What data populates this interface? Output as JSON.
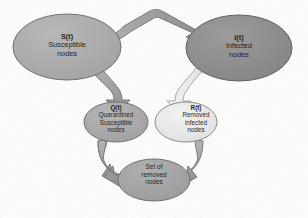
{
  "diagram": {
    "background_color": "#fdfdfc",
    "nodes": [
      {
        "id": "susceptible",
        "symbol": "S(t)",
        "line2": "Susceptible",
        "line3": "nodes",
        "fill": "#a9a9a9",
        "stroke": "#6e6e6e"
      },
      {
        "id": "infected",
        "symbol": "I(t)",
        "line2": "Infected",
        "line3": "nodes",
        "fill": "#8c8c8c",
        "stroke": "#5e5e5e"
      },
      {
        "id": "quarantined",
        "symbol": "Q(t)",
        "line2": "Quarantined",
        "line3": "Susceptible",
        "line4": "nodes",
        "fill": "#a9a9a9",
        "stroke": "#6e6e6e"
      },
      {
        "id": "removed-infected",
        "symbol": "R(t)",
        "line2": "Removed",
        "line3": "infected",
        "line4": "nodes",
        "fill": "#eaeaea",
        "stroke": "#8a8a8a"
      },
      {
        "id": "set-of-removed",
        "line2": "Set of",
        "line3": "removed",
        "line4": "nodes",
        "fill": "#a2a2a2",
        "stroke": "#6e6e6e"
      }
    ],
    "arrows": [
      {
        "id": "s-to-i",
        "from": "susceptible",
        "to": "infected",
        "fill": "#a4a4a4",
        "stroke": "#6b6b6b"
      },
      {
        "id": "s-to-q",
        "from": "susceptible",
        "to": "quarantined",
        "fill": "#a4a4a4",
        "stroke": "#6b6b6b"
      },
      {
        "id": "i-to-r",
        "from": "infected",
        "to": "removed-infected",
        "fill": "#ededed",
        "stroke": "#9a9a9a"
      },
      {
        "id": "q-to-set",
        "from": "quarantined",
        "to": "set-of-removed",
        "fill": "#9e9e9e",
        "stroke": "#6b6b6b"
      },
      {
        "id": "r-to-set",
        "from": "removed-infected",
        "to": "set-of-removed",
        "fill": "#9e9e9e",
        "stroke": "#6b6b6b"
      }
    ]
  }
}
